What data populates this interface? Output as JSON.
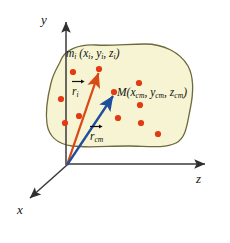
{
  "figure": {
    "type": "physics-vector-diagram",
    "background_color": "#ffffff"
  },
  "axes": {
    "y_label": "y",
    "z_label": "z",
    "x_label": "x",
    "color": "#3a3a3a",
    "origin": {
      "x": 67,
      "y": 165
    },
    "y_axis_end": {
      "x": 66,
      "y": 20
    },
    "z_axis_end": {
      "x": 208,
      "y": 164
    },
    "x_axis_end": {
      "x": 27,
      "y": 200
    }
  },
  "body": {
    "fill_color": "#f6f4d2",
    "stroke_color": "#6d6a3c",
    "name": "rigid-body-blob"
  },
  "labels": {
    "particle": {
      "mass": "m",
      "mass_sub": "i",
      "open": " (x",
      "x_sub": "i",
      "sep1": ", y",
      "y_sub": "i",
      "sep2": ", z",
      "z_sub": "i",
      "close": ")"
    },
    "center_of_mass": {
      "mass": "M",
      "open": "(x",
      "x_sub": "cm",
      "sep1": ", y",
      "y_sub": "cm",
      "sep2": ", z",
      "z_sub": "cm",
      "close": ")"
    },
    "vector_ri": {
      "symbol": "r",
      "sub": "i"
    },
    "vector_rcm": {
      "symbol": "r",
      "sub": "cm"
    }
  },
  "vectors": [
    {
      "name": "r-i",
      "color": "#d94a16",
      "from": {
        "x": 67,
        "y": 165
      },
      "to": {
        "x": 99,
        "y": 69
      }
    },
    {
      "name": "r-cm",
      "color": "#1f4e9c",
      "from": {
        "x": 67,
        "y": 165
      },
      "to": {
        "x": 114,
        "y": 92
      }
    }
  ],
  "particles": {
    "color": "#e23a12",
    "radius": 3.1,
    "points": [
      {
        "x": 73,
        "y": 72
      },
      {
        "x": 99,
        "y": 69
      },
      {
        "x": 61,
        "y": 99
      },
      {
        "x": 79,
        "y": 116
      },
      {
        "x": 65,
        "y": 123
      },
      {
        "x": 139,
        "y": 83
      },
      {
        "x": 140,
        "y": 105
      },
      {
        "x": 114,
        "y": 92
      },
      {
        "x": 118,
        "y": 118
      },
      {
        "x": 141,
        "y": 123
      },
      {
        "x": 158,
        "y": 134
      }
    ]
  }
}
